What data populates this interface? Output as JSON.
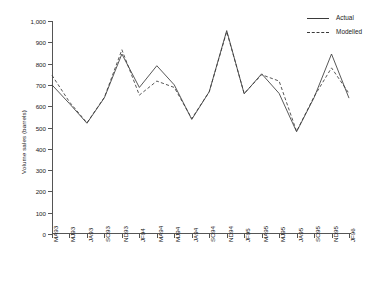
{
  "chart_data": {
    "type": "line",
    "title": "",
    "xlabel": "",
    "ylabel": "Volume sales (barrels)",
    "ylim": [
      0,
      1000
    ],
    "ytick_step": 100,
    "grid": false,
    "legend_position": "top-right",
    "categories": [
      "MA93",
      "MJ93",
      "JA93",
      "SO93",
      "ND93",
      "JF94",
      "MA94",
      "MJ94",
      "JA94",
      "SO94",
      "ND94",
      "JF95",
      "MA95",
      "MJ95",
      "JA95",
      "SO95",
      "ND95",
      "JF96"
    ],
    "ytick_labels": [
      "0",
      "100",
      "200",
      "300",
      "400",
      "500",
      "600",
      "700",
      "800",
      "900",
      "1,000"
    ],
    "ytick_values": [
      0,
      100,
      200,
      300,
      400,
      500,
      600,
      700,
      800,
      900,
      1000
    ],
    "series": [
      {
        "name": "Actual",
        "style": "solid",
        "color": "#3a3a3a",
        "values": [
          700,
          612,
          520,
          640,
          845,
          688,
          790,
          700,
          538,
          668,
          955,
          658,
          752,
          660,
          480,
          640,
          845,
          638
        ]
      },
      {
        "name": "Modelled",
        "style": "dashed",
        "color": "#3a3a3a",
        "values": [
          745,
          620,
          522,
          642,
          865,
          652,
          718,
          688,
          542,
          668,
          950,
          660,
          748,
          718,
          482,
          645,
          780,
          660
        ]
      }
    ]
  },
  "legend": {
    "items": [
      {
        "label": "Actual",
        "style": "solid"
      },
      {
        "label": "Modelled",
        "style": "dashed"
      }
    ]
  }
}
